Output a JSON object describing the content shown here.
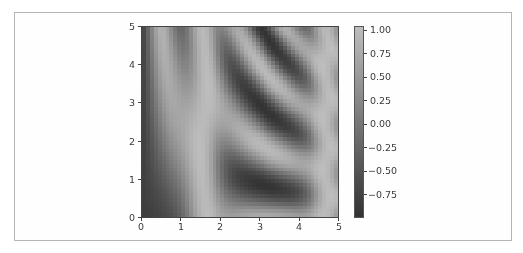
{
  "chart_data": {
    "type": "heatmap",
    "title": "",
    "xlabel": "",
    "ylabel": "",
    "function": "z = sin(x)^10 + cos(10 + y*x) * cos(x)",
    "xlim": [
      0,
      5
    ],
    "ylim": [
      0,
      5
    ],
    "grid_resolution": [
      50,
      50
    ],
    "colormap": "gray",
    "clim": [
      -1.0,
      1.05
    ],
    "x_ticks": [
      "0",
      "1",
      "2",
      "3",
      "4",
      "5"
    ],
    "y_ticks": [
      "0",
      "1",
      "2",
      "3",
      "4",
      "5"
    ],
    "colorbar": {
      "ticks": [
        "1.00",
        "0.75",
        "0.50",
        "0.25",
        "0.00",
        "−0.25",
        "−0.50",
        "−0.75"
      ],
      "tick_values": [
        1.0,
        0.75,
        0.5,
        0.25,
        0.0,
        -0.25,
        -0.5,
        -0.75
      ],
      "color_low": "#333333",
      "color_high": "#bdbdbd"
    },
    "grid": false
  }
}
